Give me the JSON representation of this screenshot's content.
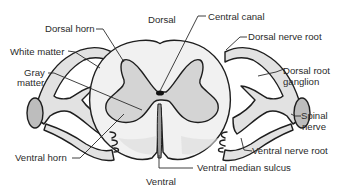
{
  "diagram": {
    "orientation": {
      "top": "Dorsal",
      "bottom": "Ventral"
    },
    "labels": {
      "dorsal_horn": "Dorsal horn",
      "white_matter": "White matter",
      "gray_matter_line1": "Gray",
      "gray_matter_line2": "matter",
      "ventral_horn": "Ventral horn",
      "central_canal": "Central canal",
      "dorsal_nerve_root": "Dorsal nerve root",
      "dorsal_root_ganglion_line1": "Dorsal root",
      "dorsal_root_ganglion_line2": "ganglion",
      "spinal_nerve_line1": "Spinal",
      "spinal_nerve_line2": "nerve",
      "ventral_nerve_root": "Ventral nerve root",
      "ventral_median_sulcus": "Ventral median sulcus"
    },
    "colors": {
      "white_matter": "#f1f1f1",
      "gray_matter": "#d4d4d4",
      "nerve": "#e2e2e2",
      "nerve_cut": "#bdbdbd",
      "outline": "#1e1e1e",
      "text": "#2b2b2b",
      "background": "#ffffff"
    }
  }
}
